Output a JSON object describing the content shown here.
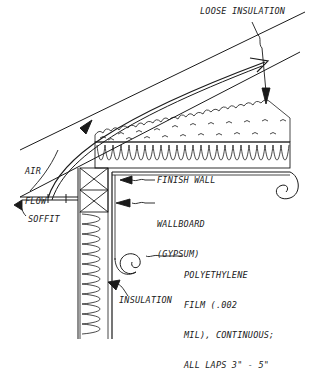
{
  "diagram": {
    "type": "architectural-section",
    "labels": {
      "loose_insulation": "LOOSE INSULATION",
      "air_flow_line1": "AIR",
      "air_flow_line2": "FLOW",
      "soffit": "SOFFIT",
      "finish_wall": "FINISH WALL",
      "wallboard_line1": "WALLBOARD",
      "wallboard_line2": "(GYPSUM)",
      "polyethylene_line1": "POLYETHYLENE",
      "polyethylene_line2": "FILM (.002",
      "polyethylene_line3": "MIL), CONTINUOUS;",
      "polyethylene_line4": "ALL LAPS 3\" - 5\"",
      "insulation": "INSULATION"
    },
    "colors": {
      "ink": "#1a1a1a",
      "background": "#ffffff"
    }
  }
}
